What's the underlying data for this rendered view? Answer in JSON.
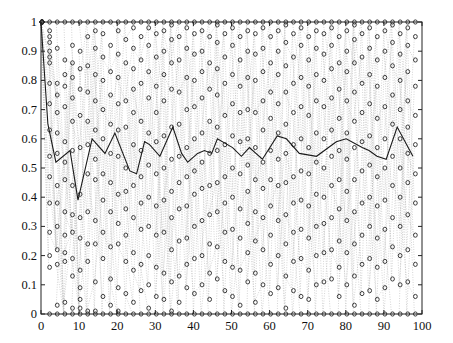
{
  "chart_data": {
    "type": "scatter",
    "title": "",
    "xlabel": "",
    "ylabel": "",
    "xlim": [
      0,
      100
    ],
    "ylim": [
      0,
      1
    ],
    "xticks": [
      0,
      10,
      20,
      30,
      40,
      50,
      60,
      70,
      80,
      90,
      100
    ],
    "yticks": [
      0,
      0.1,
      0.2,
      0.3,
      0.4,
      0.5,
      0.6,
      0.7,
      0.8,
      0.9,
      1
    ],
    "xtick_labels": [
      "0",
      "10",
      "20",
      "30",
      "40",
      "50",
      "60",
      "70",
      "80",
      "90",
      "100"
    ],
    "ytick_labels": [
      "0",
      "0.1",
      "0.2",
      "0.3",
      "0.4",
      "0.5",
      "0.6",
      "0.7",
      "0.8",
      "0.9",
      "1"
    ],
    "grid": false,
    "legend": null,
    "series": [
      {
        "name": "mean",
        "style": "solid-line",
        "color": "#222222",
        "x": [
          0,
          1.8,
          3.9,
          7.6,
          9.7,
          13.4,
          16.8,
          19.4,
          23.3,
          25.1,
          27.2,
          28.5,
          31.2,
          34.6,
          36.9,
          38.5,
          41.1,
          42.9,
          44.8,
          46.3,
          50.3,
          52.6,
          54.7,
          58.1,
          62.0,
          64.4,
          67.8,
          72.3,
          77.5,
          80.1,
          84.3,
          86.1,
          88.2,
          90.6,
          93.5,
          97.6
        ],
        "y": [
          1.0,
          0.65,
          0.52,
          0.56,
          0.39,
          0.6,
          0.55,
          0.62,
          0.49,
          0.48,
          0.59,
          0.58,
          0.54,
          0.64,
          0.55,
          0.52,
          0.55,
          0.56,
          0.55,
          0.6,
          0.57,
          0.54,
          0.57,
          0.53,
          0.61,
          0.6,
          0.55,
          0.54,
          0.59,
          0.6,
          0.57,
          0.56,
          0.54,
          0.53,
          0.64,
          0.54
        ]
      },
      {
        "name": "samples",
        "style": "circle-markers-dotted-lines",
        "color": "#333333",
        "line_color": "#bbbbbb",
        "marker": "o",
        "column_x": [
          0,
          2,
          4,
          6,
          8,
          10,
          12,
          14,
          16,
          18,
          20,
          22,
          24,
          26,
          28,
          30,
          32,
          34,
          36,
          38,
          40,
          42,
          44,
          46,
          48,
          50,
          52,
          54,
          56,
          58,
          60,
          62,
          64,
          66,
          68,
          70,
          72,
          74,
          76,
          78,
          80,
          82,
          84,
          86,
          88,
          90,
          92,
          94,
          96,
          98
        ],
        "columns": [
          [
            1,
            1,
            1,
            1,
            1,
            1,
            1,
            1,
            1,
            1
          ],
          [
            1,
            0.97,
            0.95,
            0.93,
            0.9,
            0.88,
            0.86,
            0.79,
            0.72,
            0.63,
            0.54,
            0.47,
            0.38,
            0.28,
            0.2,
            0.16,
            0
          ],
          [
            1,
            0.91,
            0.79,
            0.75,
            0.69,
            0.62,
            0.55,
            0.44,
            0.38,
            0.3,
            0.22,
            0.17,
            0.03,
            0
          ],
          [
            1,
            0.87,
            0.82,
            0.78,
            0.71,
            0.59,
            0.52,
            0.46,
            0.35,
            0.27,
            0.21,
            0.18,
            0.04,
            0
          ],
          [
            1,
            0.92,
            0.86,
            0.81,
            0.74,
            0.66,
            0.56,
            0.44,
            0.34,
            0.28,
            0.19,
            0.13,
            0.02,
            0
          ],
          [
            1,
            0.9,
            0.84,
            0.77,
            0.68,
            0.57,
            0.41,
            0.33,
            0.26,
            0.15,
            0.09,
            0.05,
            0.02,
            0
          ],
          [
            1,
            0.95,
            0.85,
            0.76,
            0.66,
            0.58,
            0.48,
            0.35,
            0.24,
            0.18,
            0.01,
            0
          ],
          [
            1,
            0.97,
            0.91,
            0.82,
            0.73,
            0.63,
            0.53,
            0.46,
            0.32,
            0.24,
            0.11,
            0.01,
            0
          ],
          [
            1,
            0.96,
            0.88,
            0.8,
            0.7,
            0.6,
            0.48,
            0.39,
            0.28,
            0.19,
            0.06,
            0
          ],
          [
            1,
            0.92,
            0.83,
            0.75,
            0.65,
            0.55,
            0.45,
            0.35,
            0.23,
            0.12,
            0.03,
            0
          ],
          [
            1,
            0.97,
            0.89,
            0.81,
            0.72,
            0.63,
            0.54,
            0.41,
            0.31,
            0.24,
            0.09,
            0.01,
            0
          ],
          [
            1,
            0.94,
            0.86,
            0.73,
            0.64,
            0.5,
            0.42,
            0.36,
            0.27,
            0.18,
            0.07,
            0
          ],
          [
            1,
            0.98,
            0.91,
            0.84,
            0.77,
            0.69,
            0.58,
            0.44,
            0.33,
            0.21,
            0.15,
            0.04,
            0
          ],
          [
            1,
            0.95,
            0.87,
            0.79,
            0.66,
            0.56,
            0.47,
            0.38,
            0.29,
            0.17,
            0.08,
            0
          ],
          [
            1,
            0.98,
            0.92,
            0.83,
            0.74,
            0.62,
            0.51,
            0.4,
            0.3,
            0.2,
            0.1,
            0.02,
            0
          ],
          [
            1,
            0.96,
            0.88,
            0.78,
            0.69,
            0.59,
            0.48,
            0.37,
            0.27,
            0.16,
            0.06,
            0
          ],
          [
            1,
            0.97,
            0.9,
            0.82,
            0.73,
            0.61,
            0.5,
            0.39,
            0.28,
            0.14,
            0.05,
            0
          ],
          [
            1,
            0.99,
            0.94,
            0.86,
            0.77,
            0.64,
            0.53,
            0.42,
            0.33,
            0.22,
            0.11,
            0.01,
            0
          ],
          [
            1,
            0.95,
            0.87,
            0.76,
            0.65,
            0.54,
            0.45,
            0.36,
            0.25,
            0.13,
            0.04,
            0
          ],
          [
            1,
            0.98,
            0.91,
            0.81,
            0.7,
            0.57,
            0.47,
            0.37,
            0.26,
            0.17,
            0.09,
            0
          ],
          [
            1,
            0.96,
            0.89,
            0.8,
            0.71,
            0.6,
            0.49,
            0.41,
            0.3,
            0.19,
            0.07,
            0
          ],
          [
            1,
            0.97,
            0.9,
            0.83,
            0.74,
            0.62,
            0.52,
            0.43,
            0.32,
            0.2,
            0.1,
            0
          ],
          [
            1,
            0.95,
            0.86,
            0.77,
            0.66,
            0.55,
            0.44,
            0.34,
            0.24,
            0.14,
            0.05,
            0
          ],
          [
            1,
            0.99,
            0.93,
            0.84,
            0.75,
            0.64,
            0.56,
            0.45,
            0.35,
            0.23,
            0.12,
            0
          ],
          [
            1,
            0.96,
            0.88,
            0.79,
            0.68,
            0.58,
            0.47,
            0.38,
            0.28,
            0.18,
            0.08,
            0
          ],
          [
            1,
            0.98,
            0.92,
            0.82,
            0.72,
            0.61,
            0.5,
            0.4,
            0.29,
            0.16,
            0.06,
            0
          ],
          [
            1,
            0.95,
            0.87,
            0.78,
            0.69,
            0.59,
            0.48,
            0.36,
            0.26,
            0.15,
            0.03,
            0
          ],
          [
            1,
            0.97,
            0.9,
            0.81,
            0.7,
            0.6,
            0.51,
            0.42,
            0.31,
            0.21,
            0.11,
            0
          ],
          [
            1,
            0.96,
            0.89,
            0.8,
            0.69,
            0.57,
            0.46,
            0.35,
            0.25,
            0.14,
            0.04,
            0
          ],
          [
            1,
            0.98,
            0.91,
            0.83,
            0.73,
            0.63,
            0.52,
            0.43,
            0.33,
            0.22,
            0.1,
            0
          ],
          [
            1,
            0.95,
            0.86,
            0.76,
            0.67,
            0.56,
            0.46,
            0.37,
            0.27,
            0.17,
            0.07,
            0
          ],
          [
            1,
            0.97,
            0.9,
            0.82,
            0.72,
            0.62,
            0.53,
            0.44,
            0.32,
            0.2,
            0.09,
            0
          ],
          [
            1,
            0.99,
            0.93,
            0.85,
            0.76,
            0.65,
            0.55,
            0.45,
            0.34,
            0.24,
            0.13,
            0.02,
            0
          ],
          [
            1,
            0.96,
            0.88,
            0.79,
            0.69,
            0.58,
            0.47,
            0.38,
            0.28,
            0.18,
            0.08,
            0
          ],
          [
            1,
            0.98,
            0.92,
            0.81,
            0.71,
            0.6,
            0.49,
            0.39,
            0.29,
            0.19,
            0.06,
            0
          ],
          [
            1,
            0.95,
            0.87,
            0.78,
            0.68,
            0.57,
            0.48,
            0.37,
            0.26,
            0.15,
            0.05,
            0
          ],
          [
            1,
            0.97,
            0.91,
            0.82,
            0.73,
            0.62,
            0.52,
            0.41,
            0.3,
            0.2,
            0.1,
            0
          ],
          [
            1,
            0.96,
            0.89,
            0.8,
            0.71,
            0.6,
            0.5,
            0.4,
            0.31,
            0.21,
            0.11,
            0
          ],
          [
            1,
            0.98,
            0.92,
            0.84,
            0.74,
            0.63,
            0.54,
            0.44,
            0.33,
            0.22,
            0.12,
            0
          ],
          [
            1,
            0.95,
            0.86,
            0.77,
            0.67,
            0.56,
            0.46,
            0.36,
            0.25,
            0.16,
            0.06,
            0
          ],
          [
            1,
            0.97,
            0.9,
            0.83,
            0.73,
            0.62,
            0.53,
            0.42,
            0.32,
            0.21,
            0.1,
            0
          ],
          [
            1,
            0.99,
            0.94,
            0.86,
            0.76,
            0.66,
            0.57,
            0.46,
            0.35,
            0.24,
            0.13,
            0.03,
            0
          ],
          [
            1,
            0.96,
            0.88,
            0.79,
            0.69,
            0.59,
            0.49,
            0.38,
            0.27,
            0.17,
            0.07,
            0
          ],
          [
            1,
            0.98,
            0.91,
            0.82,
            0.72,
            0.61,
            0.51,
            0.4,
            0.3,
            0.19,
            0.08,
            0
          ],
          [
            1,
            0.95,
            0.87,
            0.78,
            0.67,
            0.57,
            0.47,
            0.37,
            0.26,
            0.16,
            0.05,
            0
          ],
          [
            1,
            0.97,
            0.9,
            0.81,
            0.71,
            0.6,
            0.5,
            0.39,
            0.29,
            0.18,
            0.09,
            0
          ],
          [
            1,
            0.99,
            0.93,
            0.85,
            0.75,
            0.65,
            0.54,
            0.44,
            0.33,
            0.23,
            0.12,
            0
          ],
          [
            1,
            0.96,
            0.89,
            0.8,
            0.7,
            0.6,
            0.5,
            0.4,
            0.3,
            0.2,
            0.1,
            0
          ],
          [
            1,
            0.98,
            0.92,
            0.83,
            0.73,
            0.64,
            0.55,
            0.45,
            0.34,
            0.22,
            0.11,
            0
          ],
          [
            1,
            0.95,
            0.87,
            0.78,
            0.68,
            0.58,
            0.48,
            0.38,
            0.27,
            0.17,
            0.06,
            0
          ]
        ]
      }
    ]
  },
  "plot_area": {
    "left": 41,
    "right": 422,
    "top": 22,
    "bottom": 314
  },
  "colors": {
    "axis": "#222222",
    "marker": "#2a2a2a",
    "dotted_line": "#b8b8b8",
    "mean_line": "#1a1a1a",
    "background": "#ffffff"
  }
}
